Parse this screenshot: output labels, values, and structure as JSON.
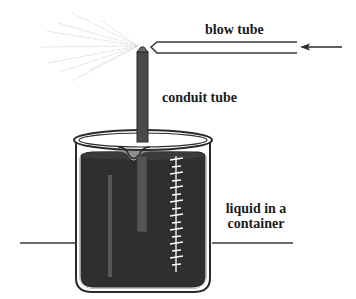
{
  "figure": {
    "type": "diagram",
    "labels": {
      "blow_tube": "blow tube",
      "conduit_tube": "conduit tube",
      "liquid_line1": "liquid in a",
      "liquid_line2": "container"
    },
    "arrow": {
      "direction": "left",
      "meaning": "air flow into blow tube"
    },
    "colors": {
      "line": "#3a3a3a",
      "liquid": "#2f2f2f",
      "tube": "#4a4a4a",
      "spray": "#c8c8c8",
      "scale_marks": "#ffffff",
      "background": "#ffffff"
    },
    "scale": {
      "tick_count": 16
    }
  }
}
